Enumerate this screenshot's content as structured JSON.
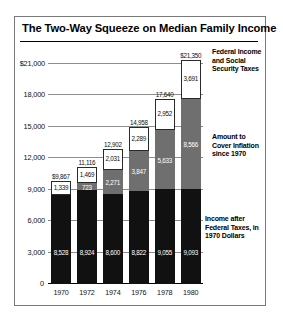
{
  "title": "The Two-Way Squeeze on Median Family Income",
  "axis": {
    "yticks": [
      "$21,000",
      "18,000",
      "15,000",
      "12,000",
      "9,000",
      "6,000",
      "3,000",
      "0"
    ],
    "yvalues": [
      21000,
      18000,
      15000,
      12000,
      9000,
      6000,
      3000,
      0
    ],
    "ymax": 22500,
    "xlabels": [
      "1970",
      "1972",
      "1974",
      "1976",
      "1978",
      "1980"
    ]
  },
  "legend": {
    "tax": "Federal Income and Social Security Taxes",
    "inflation": "Amount to Cover Inflation since 1970",
    "base": "Income after Federal Taxes, in 1970 Dollars"
  },
  "colors": {
    "base": "#111111",
    "inflation": "#6f6f6f",
    "tax": "#ffffff",
    "grid": "#8d8d8d",
    "frame": "#7a7a7a"
  },
  "chart_data": {
    "type": "bar",
    "title": "The Two-Way Squeeze on Median Family Income",
    "xlabel": "",
    "ylabel": "",
    "ylim": [
      0,
      22500
    ],
    "grid": true,
    "stacked": true,
    "legend_position": "right",
    "categories": [
      "1970",
      "1972",
      "1974",
      "1976",
      "1978",
      "1980"
    ],
    "series": [
      {
        "name": "Income after Federal Taxes, in 1970 Dollars",
        "values": [
          8528,
          8924,
          8600,
          8822,
          9055,
          9093
        ]
      },
      {
        "name": "Amount to Cover Inflation since 1970",
        "values": [
          0,
          723,
          2271,
          3847,
          5633,
          8566
        ]
      },
      {
        "name": "Federal Income and Social Security Taxes",
        "values": [
          1339,
          1469,
          2031,
          2289,
          2952,
          3691
        ]
      }
    ],
    "totals": [
      9867,
      11116,
      12902,
      14958,
      17640,
      21350
    ],
    "total_labels": [
      "$9,867",
      "11,116",
      "12,902",
      "14,958",
      "17,640",
      "$21,350"
    ],
    "base_labels": [
      "8,528",
      "8,924",
      "8,600",
      "8,822",
      "9,055",
      "9,093"
    ],
    "inflation_labels": [
      "",
      "723",
      "2,271",
      "3,847",
      "5,633",
      "8,566"
    ],
    "tax_labels": [
      "1,339",
      "1,469",
      "2,031",
      "2,289",
      "2,952",
      "3,691"
    ]
  }
}
